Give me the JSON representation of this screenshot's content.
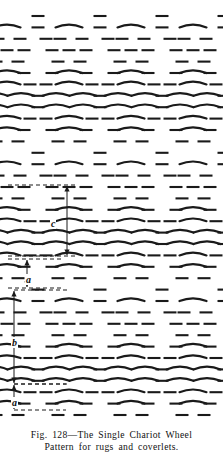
{
  "figure": {
    "name": "weaving-draft-single-chariot-wheel",
    "ink_color": "#1a1a1a",
    "paper_color": "#ffffff",
    "caption": {
      "line1": "Fig. 128—The Single Chariot Wheel",
      "line2": "Pattern for rugs and coverlets."
    },
    "figure_number": "Fig. 128",
    "dimensions": [
      {
        "id": "c",
        "label": "c",
        "label_x": 50,
        "label_y": 218,
        "axis_x": 67,
        "top_y": 186,
        "bottom_y": 255,
        "guide_top_y": 185,
        "guide_bottom_y": 256,
        "guide_x1": 8,
        "guide_x2": 78
      },
      {
        "id": "a-upper",
        "label": "a",
        "label_x": 25,
        "label_y": 274,
        "axis_x": 27,
        "top_y": 260,
        "bottom_y": 287,
        "guide_top_y": 259,
        "guide_bottom_y": 288,
        "guide_x1": 8,
        "guide_x2": 62
      },
      {
        "id": "b",
        "label": "b",
        "label_x": 11,
        "label_y": 337,
        "axis_x": 14,
        "top_y": 291,
        "bottom_y": 383,
        "guide_top_y": 290,
        "guide_bottom_y": 384,
        "guide_x1": 14,
        "guide_x2": 70
      },
      {
        "id": "a-lower",
        "label": "a",
        "label_x": 11,
        "label_y": 397,
        "axis_x": 14,
        "top_y": 385,
        "bottom_y": 409,
        "guide_top_y": 384,
        "guide_bottom_y": 410,
        "guide_x1": 14,
        "guide_x2": 66
      }
    ],
    "pattern": {
      "description": "Repeating chariot-wheel weaving draft of short dashes and shallow arcs",
      "unit_width": 62,
      "unit_height": 69,
      "row_pitch": 11.4,
      "dash_length": 13,
      "arc_length": 27
    }
  }
}
